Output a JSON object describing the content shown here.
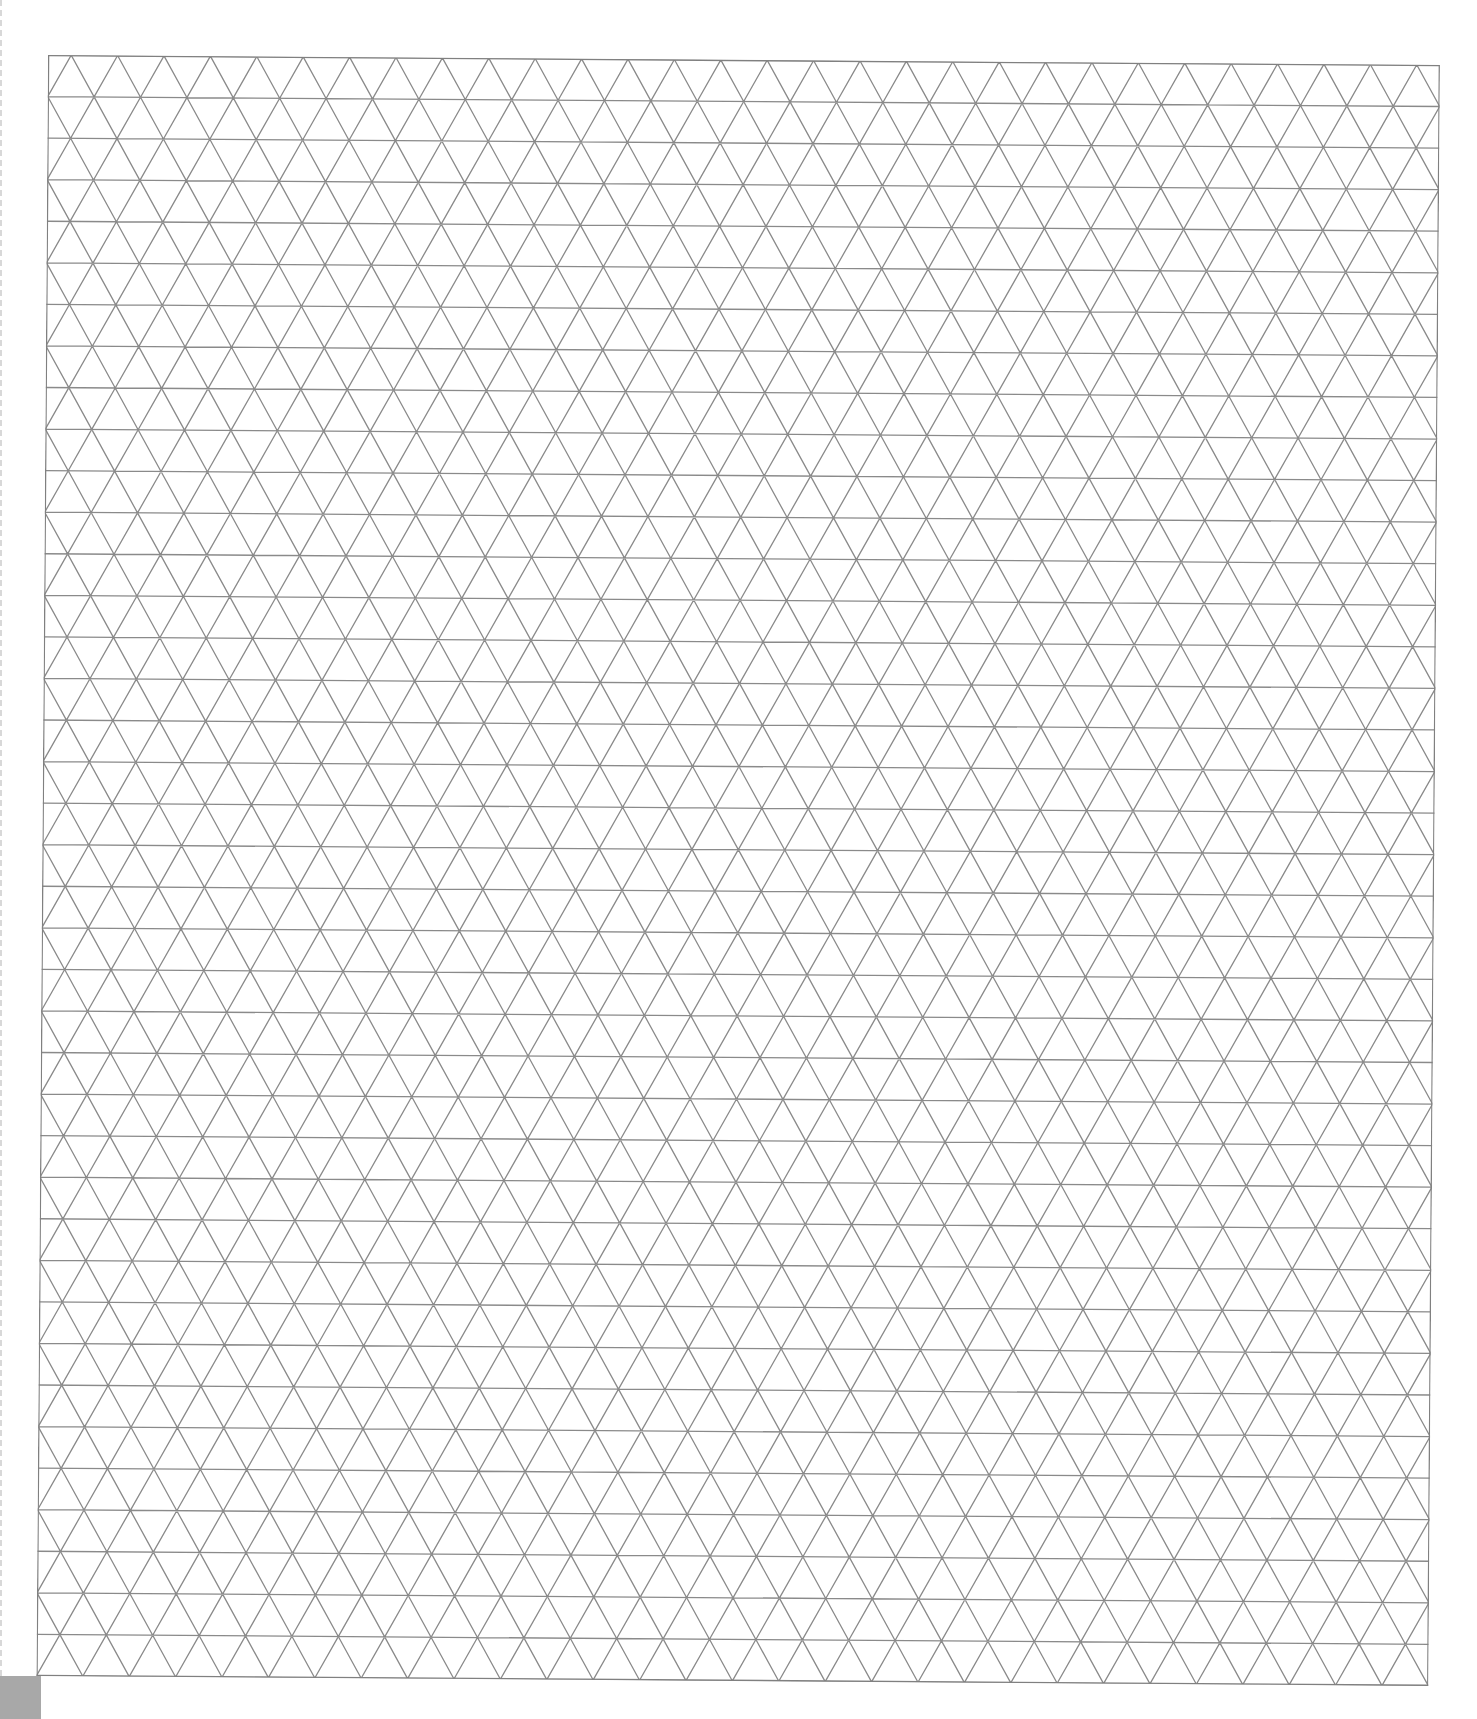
{
  "page": {
    "type": "triangle-grid-paper",
    "grid": {
      "rows": 39,
      "columns": 30,
      "cell_width_px": 46.4,
      "row_height_px": 41.6,
      "line_color": "#8a8a8a",
      "border_color": "#808080",
      "line_width_px": 1.3
    },
    "corner_block_color": "#a8a8a8"
  }
}
